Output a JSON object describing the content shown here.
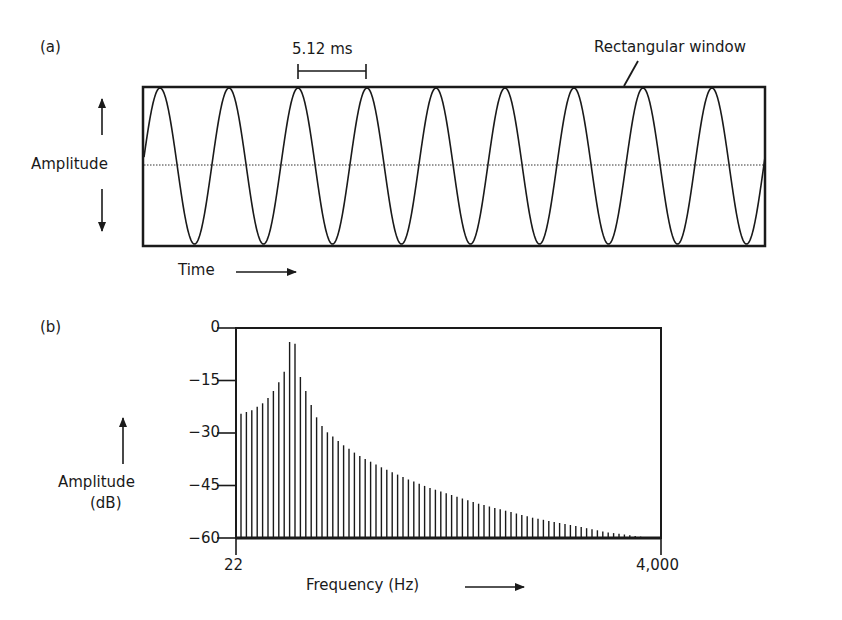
{
  "chart_data": [
    {
      "panel": "(a)",
      "type": "line",
      "title": "",
      "xlabel": "Time",
      "ylabel": "Amplitude",
      "annotations": [
        "5.12 ms",
        "Rectangular window"
      ],
      "period_label": "5.12 ms",
      "cycles_shown": 9,
      "grid": false,
      "centerline": "dotted"
    },
    {
      "panel": "(b)",
      "type": "bar",
      "title": "",
      "xlabel": "Frequency (Hz)",
      "ylabel": "Amplitude (dB)",
      "ylim": [
        -60,
        0
      ],
      "yticks": [
        "0",
        "−15",
        "−30",
        "−45",
        "−60"
      ],
      "xticks": [
        "22",
        "4,000"
      ],
      "xlim": [
        22,
        4000
      ],
      "values": [
        -24.5,
        -24,
        -23.5,
        -22.5,
        -21.5,
        -20,
        -18,
        -15.5,
        -12.5,
        -4,
        -4.5,
        -14,
        -18,
        -22,
        -25.5,
        -28,
        -29.8,
        -31,
        -32.3,
        -33.5,
        -34.5,
        -35.6,
        -36.6,
        -37.4,
        -38.2,
        -39,
        -39.8,
        -40.5,
        -41.2,
        -41.9,
        -42.6,
        -43.3,
        -43.9,
        -44.5,
        -45.1,
        -45.7,
        -46.2,
        -46.7,
        -47.2,
        -47.7,
        -48.2,
        -48.7,
        -49.2,
        -49.7,
        -50.2,
        -50.6,
        -51,
        -51.4,
        -51.8,
        -52.2,
        -52.6,
        -53,
        -53.4,
        -53.8,
        -54.2,
        -54.5,
        -54.8,
        -55.1,
        -55.4,
        -55.7,
        -56,
        -56.3,
        -56.6,
        -56.9,
        -57.2,
        -57.5,
        -57.8,
        -58.1,
        -58.4,
        -58.6,
        -58.8,
        -59,
        -59.2,
        -59.4,
        -59.6
      ]
    }
  ],
  "panel_a": {
    "label": "(a)",
    "period": "5.12 ms",
    "window_label": "Rectangular window",
    "y_label": "Amplitude",
    "x_label": "Time"
  },
  "panel_b": {
    "label": "(b)",
    "y_label_line1": "Amplitude",
    "y_label_line2": "(dB)",
    "x_label": "Frequency (Hz)",
    "y_ticks": [
      "0",
      "−15",
      "−30",
      "−45",
      "−60"
    ],
    "x_min": "22",
    "x_max": "4,000"
  },
  "colors": {
    "ink": "#1a1a1a",
    "background": "#ffffff"
  }
}
